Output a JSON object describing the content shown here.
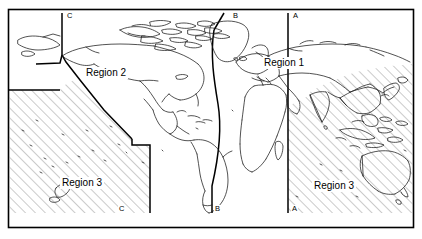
{
  "figure": {
    "type": "world-region-map",
    "background_color": "#ffffff",
    "line_color": "#000000",
    "hatch_color": "#8c8c8c",
    "frame": {
      "x": 8,
      "y": 9,
      "width": 406,
      "height": 219
    }
  },
  "regions": [
    {
      "id": "region-1",
      "label": "Region 1",
      "x": 262,
      "y": 60,
      "shaded": false
    },
    {
      "id": "region-2",
      "label": "Region 2",
      "x": 84,
      "y": 70,
      "shaded": false
    },
    {
      "id": "region-3-left",
      "label": "Region 3",
      "x": 60,
      "y": 179,
      "shaded": true
    },
    {
      "id": "region-3-right",
      "label": "Region 3",
      "x": 312,
      "y": 182,
      "shaded": true
    }
  ],
  "boundaries": [
    {
      "id": "boundary-a",
      "label": "A",
      "top_label": {
        "text": "A",
        "x": 292,
        "y": 12
      },
      "bottom_label": {
        "text": "A",
        "x": 291,
        "y": 206
      }
    },
    {
      "id": "boundary-b",
      "label": "B",
      "top_label": {
        "text": "B",
        "x": 232,
        "y": 12
      },
      "bottom_label": {
        "text": "B",
        "x": 213,
        "y": 206
      }
    },
    {
      "id": "boundary-c",
      "label": "C",
      "top_label": {
        "text": "C",
        "x": 66,
        "y": 12
      },
      "bottom_label": {
        "text": "C",
        "x": 118,
        "y": 206
      }
    }
  ]
}
